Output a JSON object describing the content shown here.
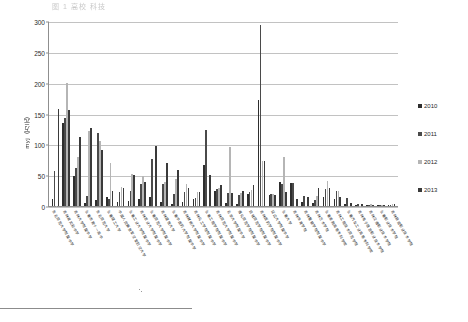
{
  "figure": {
    "top_caption": "图 1  高校  科技",
    "footnote_rule": true
  },
  "chart_data": {
    "type": "bar",
    "title": "",
    "xlabel": "",
    "ylabel": "myj（万元）",
    "ylim": [
      0,
      300
    ],
    "yticks": [
      0,
      50,
      100,
      150,
      200,
      250,
      300
    ],
    "grid": true,
    "legend_position": "right",
    "categories": [
      "东北师范大学附属中学",
      "吉林省实验中学",
      "吉林大学附属中学",
      "长春市第十一高中",
      "东北师范大学",
      "长春理工大学",
      "中国人民解放军空军航空大学",
      "长春工业大学附属中学",
      "吉林农业大学附属中学",
      "长春师范大学附属中学",
      "吉林建筑大学",
      "长春中医药大学附属中学",
      "吉林财经大学附属中学",
      "吉林化工学院附属中学",
      "长春工程学院附属中学",
      "吉林师范大学附属中学",
      "北华大学附属中学",
      "通化师范学院附属中学",
      "白城师范学院附属中学",
      "吉林医药学院附属中学",
      "延边大学附属中学",
      "长春大学",
      "吉林体育学院",
      "吉林警察学院附属中学",
      "吉林艺术学院",
      "长春金融高等专科学校",
      "吉林工程技术师范学院",
      "长春汽车工业高等专科学校",
      "吉林电子信息职业技术学院",
      "吉林交通职业技术学院",
      "长春职业技术学院",
      "吉林铁道职业技术学院"
    ],
    "series": [
      {
        "name": "2010",
        "color": "#2e2e2e",
        "values": [
          11,
          135,
          48,
          5,
          9,
          14,
          6,
          8,
          11,
          14,
          6,
          3,
          6,
          12,
          67,
          25,
          5,
          3,
          20,
          172,
          18,
          39,
          37,
          6,
          5,
          14,
          12,
          4,
          1,
          2,
          1,
          1
        ]
      },
      {
        "name": "2011",
        "color": "#4a4a4a",
        "values": [
          57,
          143,
          62,
          17,
          119,
          12,
          22,
          24,
          35,
          76,
          36,
          19,
          22,
          13,
          123,
          27,
          21,
          18,
          22,
          293,
          19,
          36,
          37,
          16,
          9,
          27,
          25,
          13,
          4,
          2,
          2,
          1
        ]
      },
      {
        "name": "2012",
        "color": "#b5b5b5",
        "values": [
          0,
          199,
          80,
          121,
          105,
          69,
          31,
          52,
          48,
          0,
          39,
          44,
          36,
          23,
          0,
          29,
          96,
          21,
          26,
          73,
          19,
          80,
          0,
          0,
          16,
          40,
          24,
          0,
          0,
          3,
          2,
          4
        ]
      },
      {
        "name": "2013",
        "color": "#3a3a3a",
        "values": [
          158,
          156,
          112,
          126,
          91,
          25,
          30,
          50,
          39,
          98,
          70,
          59,
          30,
          22,
          50,
          34,
          21,
          25,
          34,
          73,
          18,
          22,
          12,
          15,
          30,
          30,
          15,
          5,
          3,
          2,
          1,
          3
        ]
      }
    ],
    "legend": [
      "2010",
      "2011",
      "2012",
      "2013"
    ]
  }
}
